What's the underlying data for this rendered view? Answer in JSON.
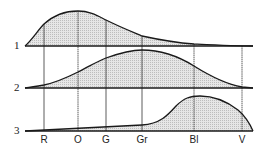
{
  "diagram": {
    "rows": [
      {
        "label": "1",
        "baseline_y": 46
      },
      {
        "label": "2",
        "baseline_y": 88
      },
      {
        "label": "3",
        "baseline_y": 131
      }
    ],
    "bands": [
      {
        "label": "R",
        "x": 44
      },
      {
        "label": "O",
        "x": 78
      },
      {
        "label": "G",
        "x": 106
      },
      {
        "label": "Gr",
        "x": 142
      },
      {
        "label": "Bl",
        "x": 194
      },
      {
        "label": "V",
        "x": 242
      }
    ],
    "colors": {
      "line": "#1a1a1a",
      "fill": "#d9d9d9"
    }
  }
}
